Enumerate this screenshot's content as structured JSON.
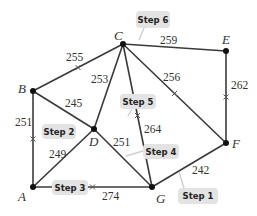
{
  "graph": {
    "nodes": [
      {
        "id": "A",
        "x": 33,
        "y": 187,
        "lx": 18,
        "ly": 201
      },
      {
        "id": "B",
        "x": 33,
        "y": 91,
        "lx": 18,
        "ly": 93
      },
      {
        "id": "C",
        "x": 123,
        "y": 44,
        "lx": 114,
        "ly": 40
      },
      {
        "id": "D",
        "x": 94,
        "y": 129,
        "lx": 89,
        "ly": 146
      },
      {
        "id": "E",
        "x": 226,
        "y": 51,
        "lx": 222,
        "ly": 44
      },
      {
        "id": "F",
        "x": 226,
        "y": 143,
        "lx": 232,
        "ly": 148
      },
      {
        "id": "G",
        "x": 152,
        "y": 187,
        "lx": 156,
        "ly": 203
      }
    ],
    "edges": [
      {
        "from": "B",
        "to": "C",
        "weight": "255",
        "lx": 66,
        "ly": 61,
        "tick": true
      },
      {
        "from": "C",
        "to": "E",
        "weight": "259",
        "lx": 160,
        "ly": 44,
        "tick": false
      },
      {
        "from": "C",
        "to": "D",
        "weight": "253",
        "lx": 91,
        "ly": 83,
        "tick": false
      },
      {
        "from": "C",
        "to": "G",
        "weight": "264",
        "lx": 144,
        "ly": 133,
        "tick": true
      },
      {
        "from": "C",
        "to": "F",
        "weight": "256",
        "lx": 163,
        "ly": 81,
        "tick": true
      },
      {
        "from": "E",
        "to": "F",
        "weight": "262",
        "lx": 231,
        "ly": 89,
        "tick": true
      },
      {
        "from": "B",
        "to": "D",
        "weight": "245",
        "lx": 65,
        "ly": 107,
        "tick": false
      },
      {
        "from": "B",
        "to": "A",
        "weight": "251",
        "lx": 15,
        "ly": 126,
        "tick": true
      },
      {
        "from": "D",
        "to": "A",
        "weight": "249",
        "lx": 49,
        "ly": 158,
        "tick": false
      },
      {
        "from": "D",
        "to": "G",
        "weight": "251",
        "lx": 113,
        "ly": 146,
        "tick": false
      },
      {
        "from": "A",
        "to": "G",
        "weight": "274",
        "lx": 102,
        "ly": 200,
        "tick": true
      },
      {
        "from": "G",
        "to": "F",
        "weight": "242",
        "lx": 192,
        "ly": 174,
        "tick": false
      }
    ],
    "callouts": [
      {
        "label": "Step 1",
        "x": 178,
        "y": 188,
        "w": 40,
        "h": 16
      },
      {
        "label": "Step 2",
        "x": 42,
        "y": 124,
        "w": 34,
        "h": 15
      },
      {
        "label": "Step 3",
        "x": 52,
        "y": 180,
        "w": 36,
        "h": 15
      },
      {
        "label": "Step 4",
        "x": 143,
        "y": 144,
        "w": 36,
        "h": 15
      },
      {
        "label": "Step 5",
        "x": 120,
        "y": 94,
        "w": 36,
        "h": 15
      },
      {
        "label": "Step 6",
        "x": 136,
        "y": 11,
        "w": 34,
        "h": 17
      }
    ]
  }
}
